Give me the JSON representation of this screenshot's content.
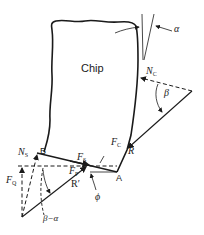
{
  "diagram": {
    "region_label": "Chip",
    "angles": {
      "rake": "α",
      "friction": "β",
      "shear": "ϕ",
      "difference": "β−α"
    },
    "points": {
      "a": "A",
      "b": "B"
    },
    "forces": {
      "normal_chip_main": "N",
      "normal_chip_sub": "C",
      "cutting_main": "F",
      "cutting_sub": "C",
      "resultant": "R",
      "resultant_prime": "R′",
      "shear_main": "F",
      "shear_sub": "S",
      "normal_shear_main": "N",
      "normal_shear_sub": "S",
      "thrust_main": "F",
      "thrust_sub": "Q",
      "power_main": "F",
      "power_sub": "P"
    },
    "colors": {
      "ink": "#1a1a1a",
      "background": "#ffffff"
    }
  }
}
